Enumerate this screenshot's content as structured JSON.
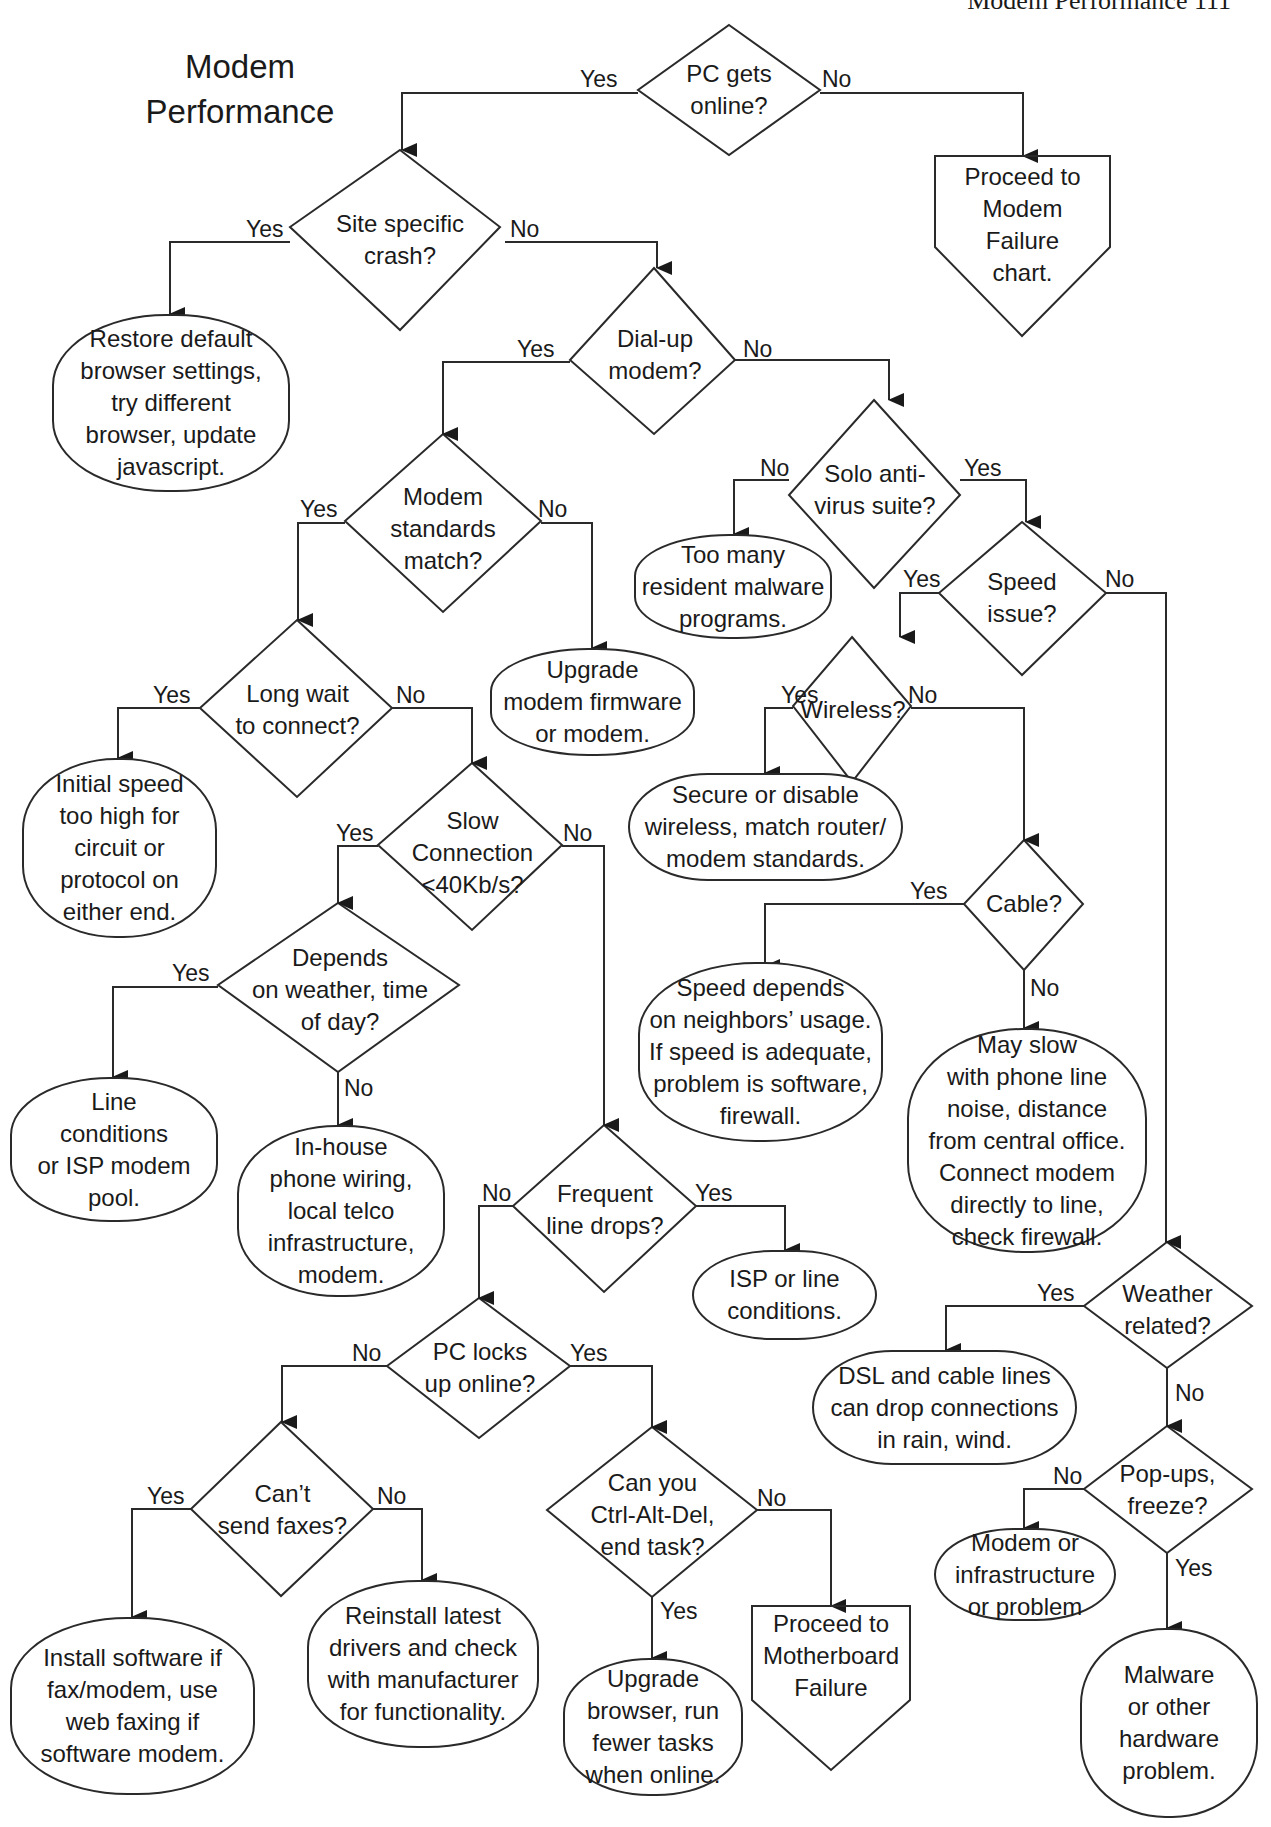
{
  "page_header": "Modem Performance   111",
  "title": "Modem\nPerformance",
  "decisions": {
    "pc_gets_online": "PC gets\nonline?",
    "site_specific_crash": "Site specific\ncrash?",
    "dial_up_modem": "Dial-up\nmodem?",
    "solo_antivirus": "Solo anti-\nvirus suite?",
    "modem_standards_match": "Modem\nstandards\nmatch?",
    "speed_issue": "Speed\nissue?",
    "long_wait": "Long wait\nto connect?",
    "wireless": "Wireless?",
    "slow_connection": "Slow\nConnection\n<40Kb/s?",
    "cable": "Cable?",
    "depends_weather": "Depends\non weather, time\nof day?",
    "frequent_drops": "Frequent\nline drops?",
    "weather_related": "Weather\nrelated?",
    "pc_locks_up": "PC locks\nup online?",
    "cant_send_faxes": "Can’t\nsend faxes?",
    "ctrl_alt_del": "Can you\nCtrl-Alt-Del,\nend task?",
    "popups_freeze": "Pop-ups,\nfreeze?"
  },
  "outcomes": {
    "modem_failure": "Proceed to\nModem\nFailure\nchart.",
    "restore_browser": "Restore default\nbrowser settings,\ntry different\nbrowser, update\njavascript.",
    "too_many_malware": "Too many\nresident malware\nprograms.",
    "upgrade_firmware": "Upgrade\nmodem firmware\nor modem.",
    "initial_speed": "Initial speed\ntoo high for\ncircuit or\nprotocol on\neither end.",
    "secure_wireless": "Secure or disable\nwireless, match router/\nmodem standards.",
    "speed_depends": "Speed depends\non neighbors’ usage.\nIf speed is adequate,\nproblem is software,\nfirewall.",
    "may_slow": "May slow\nwith phone line\nnoise, distance\nfrom central office.\nConnect modem\ndirectly to line,\ncheck firewall.",
    "line_conditions": "Line\nconditions\nor ISP modem\npool.",
    "in_house_wiring": "In-house\nphone wiring,\nlocal telco\ninfrastructure,\nmodem.",
    "isp_line": "ISP or line\nconditions.",
    "dsl_cable": "DSL and cable lines\ncan drop connections\nin rain, wind.",
    "install_software": "Install software if\nfax/modem, use\nweb faxing if\nsoftware modem.",
    "reinstall_drivers": "Reinstall latest\ndrivers and check\nwith manufacturer\nfor functionality.",
    "upgrade_browser": "Upgrade\nbrowser, run\nfewer tasks\nwhen online.",
    "motherboard_failure": "Proceed to\nMotherboard\nFailure",
    "modem_infrastructure": "Modem or\ninfrastructure\nor problem",
    "malware_hardware": "Malware\nor other\nhardware\nproblem."
  },
  "labels": {
    "yes": "Yes",
    "no": "No"
  },
  "colors": {
    "stroke": "#2a2a2a",
    "background": "#ffffff",
    "text": "#1a1a1a"
  }
}
